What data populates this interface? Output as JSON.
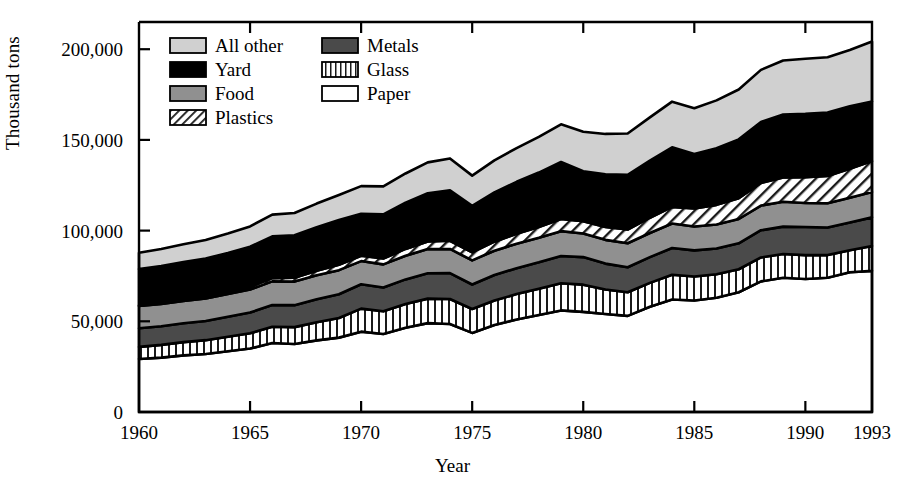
{
  "axes": {
    "ylabel": "Thousand tons",
    "xlabel": "Year",
    "y_ticks": [
      "0",
      "50,000",
      "100,000",
      "150,000",
      "200,000"
    ],
    "y_tick_values": [
      0,
      50000,
      100000,
      150000,
      200000
    ],
    "x_ticks": [
      "1960",
      "1965",
      "1970",
      "1975",
      "1980",
      "1985",
      "1990",
      "1993"
    ],
    "x_tick_values": [
      1960,
      1965,
      1970,
      1975,
      1980,
      1985,
      1990,
      1993
    ],
    "ylim": [
      0,
      215000
    ],
    "xlim": [
      1960,
      1993
    ]
  },
  "legend": {
    "entries": [
      {
        "label": "All other",
        "fill": "#d0d0d0",
        "pattern": "solid"
      },
      {
        "label": "Metals",
        "fill": "#4a4a4a",
        "pattern": "solid"
      },
      {
        "label": "Yard",
        "fill": "#000000",
        "pattern": "solid"
      },
      {
        "label": "Glass",
        "fill": "#ffffff",
        "pattern": "vertical"
      },
      {
        "label": "Food",
        "fill": "#909090",
        "pattern": "solid"
      },
      {
        "label": "Paper",
        "fill": "#ffffff",
        "pattern": "solid"
      },
      {
        "label": "Plastics",
        "fill": "#ffffff",
        "pattern": "diagonal"
      }
    ]
  },
  "chart_data": {
    "type": "area",
    "title": "",
    "xlabel": "Year",
    "ylabel": "Thousand tons",
    "ylim": [
      0,
      215000
    ],
    "xlim": [
      1960,
      1993
    ],
    "grid": false,
    "legend_position": "top-left-inside",
    "stacked": true,
    "stack_order_bottom_to_top": [
      "Paper",
      "Glass",
      "Metals",
      "Food",
      "Plastics",
      "Yard",
      "All other"
    ],
    "x": [
      1960,
      1961,
      1962,
      1963,
      1964,
      1965,
      1966,
      1967,
      1968,
      1969,
      1970,
      1971,
      1972,
      1973,
      1974,
      1975,
      1976,
      1977,
      1978,
      1979,
      1980,
      1981,
      1982,
      1983,
      1984,
      1985,
      1986,
      1987,
      1988,
      1989,
      1990,
      1991,
      1992,
      1993
    ],
    "series": [
      {
        "name": "Paper",
        "fill": "#ffffff",
        "pattern": "solid",
        "values": [
          29200,
          30000,
          31200,
          32000,
          33500,
          35000,
          38000,
          37500,
          39500,
          41000,
          44300,
          43000,
          46500,
          49000,
          48500,
          43600,
          48000,
          51000,
          53500,
          56000,
          55200,
          54000,
          53000,
          58000,
          62000,
          61500,
          63000,
          66000,
          72000,
          74000,
          73300,
          74000,
          77000,
          77800
        ]
      },
      {
        "name": "Glass",
        "fill": "#ffffff",
        "pattern": "vertical",
        "values": [
          6700,
          7000,
          7300,
          7600,
          8000,
          8400,
          9000,
          9300,
          10000,
          10800,
          12700,
          12500,
          13000,
          13500,
          13800,
          13200,
          13500,
          14000,
          14500,
          15000,
          15000,
          13500,
          13000,
          13200,
          13700,
          13200,
          12900,
          12700,
          13200,
          13100,
          13200,
          12500,
          12200,
          13700
        ]
      },
      {
        "name": "Metals",
        "fill": "#4a4a4a",
        "pattern": "solid",
        "values": [
          10300,
          10300,
          10400,
          10600,
          11000,
          11400,
          12000,
          12100,
          12700,
          13100,
          13400,
          13100,
          13600,
          14000,
          14300,
          13500,
          14000,
          14300,
          14500,
          15000,
          15200,
          14300,
          13800,
          14200,
          14700,
          14400,
          14200,
          14300,
          15000,
          15100,
          15500,
          15200,
          15300,
          15800
        ]
      },
      {
        "name": "Food",
        "fill": "#909090",
        "pattern": "solid",
        "values": [
          12200,
          12300,
          12300,
          12400,
          12500,
          12700,
          13000,
          13000,
          13200,
          13300,
          12800,
          12800,
          13000,
          13300,
          13300,
          13300,
          13400,
          13500,
          13500,
          13700,
          13000,
          13100,
          13200,
          13300,
          13500,
          13200,
          13300,
          13400,
          13600,
          13700,
          13200,
          13400,
          13600,
          14000
        ]
      },
      {
        "name": "Plastics",
        "fill": "#ffffff",
        "pattern": "diagonal",
        "values": [
          390,
          500,
          650,
          800,
          1000,
          1400,
          1800,
          2100,
          2500,
          3000,
          2900,
          3200,
          3800,
          4200,
          4500,
          4400,
          5000,
          5500,
          6000,
          6700,
          6800,
          7100,
          7600,
          8400,
          9200,
          9900,
          10800,
          11500,
          12500,
          13400,
          14200,
          15000,
          16000,
          17000
        ]
      },
      {
        "name": "Yard",
        "fill": "#000000",
        "pattern": "solid",
        "values": [
          20000,
          20400,
          20800,
          21200,
          21700,
          22200,
          23000,
          23400,
          24000,
          24700,
          23200,
          24400,
          25500,
          26600,
          27800,
          25700,
          27200,
          28600,
          30000,
          31400,
          27500,
          29000,
          30200,
          31500,
          32800,
          30000,
          31200,
          32400,
          33600,
          34700,
          35000,
          35000,
          34500,
          32900
        ]
      },
      {
        "name": "All other",
        "fill": "#d0d0d0",
        "pattern": "solid",
        "values": [
          9000,
          9400,
          9800,
          10200,
          10700,
          11200,
          12000,
          12300,
          13000,
          13700,
          15200,
          15400,
          16100,
          17000,
          17600,
          16600,
          17600,
          18600,
          19700,
          20800,
          21800,
          22300,
          22700,
          23800,
          25200,
          25300,
          26400,
          27500,
          28700,
          29800,
          30300,
          30500,
          31000,
          33000
        ]
      }
    ],
    "totals": [
      87790,
      89900,
      92450,
      94800,
      98400,
      102300,
      108800,
      107700,
      114900,
      119600,
      124500,
      124400,
      131500,
      137600,
      139800,
      130300,
      138700,
      147500,
      151700,
      158600,
      154500,
      153300,
      153500,
      162400,
      171100,
      167500,
      171800,
      177800,
      188600,
      193800,
      194700,
      195600,
      199600,
      204200
    ]
  },
  "caption": {
    "text": ""
  }
}
